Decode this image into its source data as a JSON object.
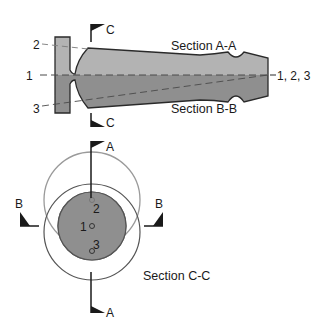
{
  "diagram": {
    "type": "technical-section-drawing",
    "labels": {
      "section_aa": "Section A-A",
      "section_bb": "Section B-B",
      "section_cc": "Section C-C",
      "axis_1": "1",
      "axis_2": "2",
      "axis_3": "3",
      "axis_end": "1, 2, 3",
      "cut_c_top": "C",
      "cut_c_bottom": "C",
      "cut_a_top": "A",
      "cut_a_bottom": "A",
      "cut_b_left": "B",
      "cut_b_right": "B",
      "point_1": "1",
      "point_2": "2",
      "point_3": "3"
    },
    "colors": {
      "upper_half": "#b3b3b3",
      "lower_half": "#8f8f8f",
      "outline": "#2a2a2a",
      "circle_light": "#9a9a9a",
      "circle_dark": "#555555",
      "crescent": "#dedede",
      "dash_line": "#4a4a4a"
    }
  }
}
